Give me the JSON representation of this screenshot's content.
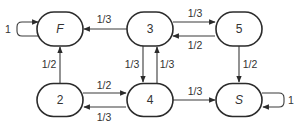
{
  "diagram": {
    "type": "markov-chain-state-diagram",
    "colors": {
      "stroke": "#2b2b2b",
      "text": "#333333",
      "background": "#ffffff"
    },
    "nodes": [
      {
        "id": "F",
        "label": "F",
        "italic": true,
        "cx": 60,
        "cy": 29,
        "w": 46,
        "h": 34
      },
      {
        "id": "3",
        "label": "3",
        "italic": false,
        "cx": 150,
        "cy": 29,
        "w": 46,
        "h": 34
      },
      {
        "id": "5",
        "label": "5",
        "italic": false,
        "cx": 239,
        "cy": 29,
        "w": 46,
        "h": 34
      },
      {
        "id": "2",
        "label": "2",
        "italic": false,
        "cx": 60,
        "cy": 100,
        "w": 46,
        "h": 33
      },
      {
        "id": "4",
        "label": "4",
        "italic": false,
        "cx": 150,
        "cy": 100,
        "w": 46,
        "h": 33
      },
      {
        "id": "S",
        "label": "S",
        "italic": true,
        "cx": 239,
        "cy": 100,
        "w": 46,
        "h": 33
      }
    ],
    "edges": [
      {
        "from": "F",
        "to": "F",
        "label": "1",
        "path": "M38,36 L22,36 Q17,36 17,31 L17,27 Q17,22 22,22 L38,22",
        "lx": 8,
        "ly": 29
      },
      {
        "from": "3",
        "to": "F",
        "label": "1/3",
        "path": "M127,29 L84,29",
        "lx": 104,
        "ly": 19
      },
      {
        "from": "3",
        "to": "5",
        "label": "1/3",
        "path": "M173,22 L215,22",
        "lx": 195,
        "ly": 13
      },
      {
        "from": "5",
        "to": "3",
        "label": "1/2",
        "path": "M215,36 L173,36",
        "lx": 195,
        "ly": 45
      },
      {
        "from": "3",
        "to": "4",
        "label": "1/3",
        "path": "M143,46 L143,82",
        "lx": 132,
        "ly": 64
      },
      {
        "from": "4",
        "to": "3",
        "label": "1/3",
        "path": "M157,83 L157,47",
        "lx": 167,
        "ly": 64
      },
      {
        "from": "2",
        "to": "F",
        "label": "1/2",
        "path": "M60,83 L60,47",
        "lx": 49,
        "ly": 64
      },
      {
        "from": "2",
        "to": "4",
        "label": "1/2",
        "path": "M83,93 L126,93",
        "lx": 104,
        "ly": 85
      },
      {
        "from": "4",
        "to": "2",
        "label": "1/3",
        "path": "M126,107 L84,107",
        "lx": 104,
        "ly": 117
      },
      {
        "from": "5",
        "to": "S",
        "label": "1/2",
        "path": "M239,46 L239,82",
        "lx": 250,
        "ly": 64
      },
      {
        "from": "4",
        "to": "S",
        "label": "1/3",
        "path": "M173,100 L215,100",
        "lx": 195,
        "ly": 91
      },
      {
        "from": "S",
        "to": "S",
        "label": "1",
        "path": "M262,93 L279,93 Q284,93 284,98 L284,102 Q284,107 279,107 L263,107",
        "lx": 291,
        "ly": 100
      }
    ]
  }
}
